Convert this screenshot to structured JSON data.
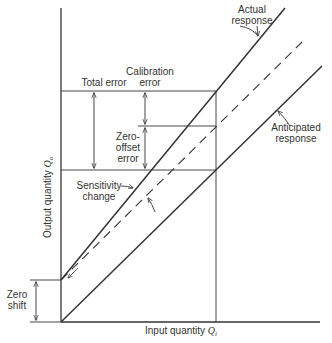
{
  "diagram": {
    "axes": {
      "y_label": "Output quantity ",
      "y_symbol": "Q",
      "y_sub": "o",
      "x_label": "Input quantity ",
      "x_symbol": "Q",
      "x_sub": "i"
    },
    "labels": {
      "actual_1": "Actual",
      "actual_2": "response",
      "anticipated_1": "Anticipated",
      "anticipated_2": "response",
      "total_error": "Total error",
      "calibration_1": "Calibration",
      "calibration_2": "error",
      "zero_offset_1": "Zero-",
      "zero_offset_2": "offset",
      "zero_offset_3": "error",
      "sensitivity_1": "Sensitivity",
      "sensitivity_2": "change",
      "zero_shift_1": "Zero",
      "zero_shift_2": "shift"
    },
    "lines": [
      {
        "name": "actual-response",
        "style": "solid"
      },
      {
        "name": "zero-shifted-reference",
        "style": "dashed"
      },
      {
        "name": "anticipated-response",
        "style": "solid"
      }
    ]
  }
}
